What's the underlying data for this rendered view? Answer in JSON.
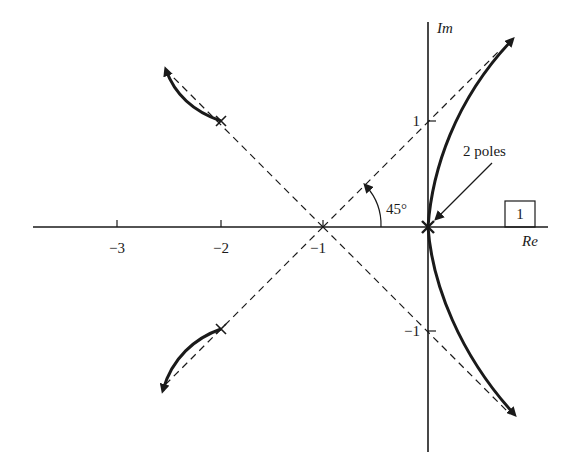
{
  "diagram": {
    "type": "root-locus",
    "axes": {
      "real_label": "Re",
      "imag_label": "Im",
      "real_ticks": [
        {
          "value": -3,
          "label": "−3"
        },
        {
          "value": -2,
          "label": "−2"
        },
        {
          "value": -1,
          "label": "−1"
        }
      ],
      "imag_ticks": [
        {
          "value": 1,
          "label": "1"
        },
        {
          "value": -1,
          "label": "−1"
        }
      ]
    },
    "poles": [
      {
        "re": -2,
        "im": 1
      },
      {
        "re": -2,
        "im": -1
      },
      {
        "re": 0,
        "im": 0,
        "multiplicity": 2
      }
    ],
    "asymptote_centroid": {
      "re": -1,
      "im": 0
    },
    "asymptote_angle_label": "45°",
    "annotation": "2 poles",
    "boxed_label": "1",
    "colors": {
      "ink": "#1a1a1a",
      "background": "#ffffff"
    }
  }
}
